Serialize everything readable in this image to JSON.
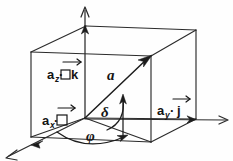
{
  "figure": {
    "background_color": "#fefefe",
    "ink_color": "#1c1c1c",
    "labels": {
      "vector_main": "a",
      "component_z_sub": "z",
      "component_z_base": "a",
      "component_z_unit": "k",
      "component_z_full": "a_z · k",
      "component_x_sub": "x",
      "component_x_base": "a",
      "component_x_unit": "i",
      "component_x_full": "a_x · i",
      "component_y_sub": "y",
      "component_y_base": "a",
      "component_y_unit": "j",
      "component_y_full": "a_y · j",
      "dot_operator": "·",
      "angle_delta": "δ",
      "angle_phi": "φ"
    },
    "geometry": {
      "origin": [
        85,
        118
      ],
      "z_axis_tip": [
        85,
        7
      ],
      "y_axis_tip": [
        228,
        120
      ],
      "x_axis_tip": [
        6,
        158
      ],
      "vector_tip": [
        151,
        56
      ],
      "box_front_top_left": [
        31,
        52
      ],
      "box_front_bottom_left": [
        31,
        137
      ],
      "box_back_top_left": [
        86,
        26
      ],
      "box_back_top_right": [
        196,
        30
      ],
      "box_front_top_right": [
        151,
        56
      ],
      "box_front_bottom_right": [
        151,
        142
      ],
      "box_right_bottom": [
        196,
        119
      ]
    },
    "icons": {
      "z_axis_arrow": "arrow-up-icon",
      "y_axis_arrow": "arrow-right-icon",
      "x_axis_arrow": "arrow-down-left-icon",
      "vector_arrow": "arrow-up-right-icon",
      "delta_arc_arrow": "arc-arrow-icon",
      "phi_arc_arrow": "arc-arrow-icon",
      "unit_vector_bar": "vector-overbar-icon"
    }
  }
}
